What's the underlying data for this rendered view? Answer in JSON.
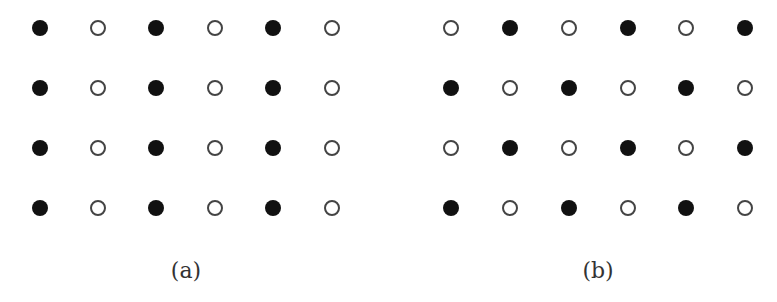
{
  "panels": [
    {
      "id": "a",
      "label": "(a)",
      "label_pos": [
        186,
        270
      ],
      "x": [
        40,
        98,
        156,
        215,
        273,
        332
      ],
      "y": [
        28,
        88,
        148,
        208
      ],
      "grid": [
        [
          1,
          0,
          1,
          0,
          1,
          0
        ],
        [
          1,
          0,
          1,
          0,
          1,
          0
        ],
        [
          1,
          0,
          1,
          0,
          1,
          0
        ],
        [
          1,
          0,
          1,
          0,
          1,
          0
        ]
      ]
    },
    {
      "id": "b",
      "label": "(b)",
      "label_pos": [
        598,
        270
      ],
      "x": [
        451,
        510,
        569,
        628,
        686,
        745
      ],
      "y": [
        28,
        88,
        148,
        208
      ],
      "grid": [
        [
          0,
          1,
          0,
          1,
          0,
          1
        ],
        [
          1,
          0,
          1,
          0,
          1,
          0
        ],
        [
          0,
          1,
          0,
          1,
          0,
          1
        ],
        [
          1,
          0,
          1,
          0,
          1,
          0
        ]
      ]
    }
  ],
  "legend": {
    "filled": "filled-circle",
    "open": "open-circle"
  },
  "colors": {
    "filled": "#111111",
    "open_stroke": "#444444",
    "background": "#ffffff"
  }
}
